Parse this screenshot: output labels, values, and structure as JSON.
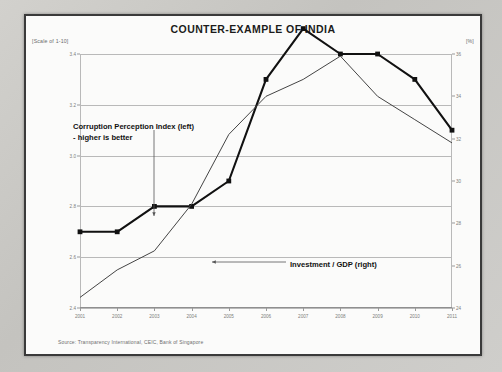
{
  "slide": {
    "title": "COUNTER-EXAMPLE OF INDIA",
    "source": "Source: Transparency International, CEIC, Bank of Singapore",
    "left_axis_note": "[Scale of 1-10]",
    "right_axis_note": "[%]",
    "annotation_cpi_line1": "Corruption Perception Index (left)",
    "annotation_cpi_line2": "- higher is better",
    "annotation_investment": "Investment / GDP (right)"
  },
  "chart_data": {
    "type": "line",
    "title": "COUNTER-EXAMPLE OF INDIA",
    "xlabel": "",
    "ylabel": "[Scale of 1-10]",
    "y2label": "[%]",
    "grid": true,
    "legend": "annotations",
    "categories": [
      "2001",
      "2002",
      "2003",
      "2004",
      "2005",
      "2006",
      "2007",
      "2008",
      "2009",
      "2010",
      "2011"
    ],
    "ylim": [
      2.4,
      3.4
    ],
    "yticks": [
      "2.4",
      "2.6",
      "2.8",
      "3.0",
      "3.2",
      "3.4"
    ],
    "y2lim": [
      24,
      36
    ],
    "y2ticks": [
      "24",
      "26",
      "28",
      "30",
      "32",
      "34",
      "36"
    ],
    "series": [
      {
        "name": "Corruption Perception Index (left)",
        "axis": "left",
        "marker": "square",
        "color": "#111111",
        "values": [
          2.7,
          2.7,
          2.8,
          2.8,
          2.9,
          3.3,
          3.5,
          3.4,
          3.4,
          3.3,
          3.1
        ]
      },
      {
        "name": "Investment / GDP (right)",
        "axis": "right",
        "marker": "none",
        "color": "#444444",
        "values": [
          24.5,
          25.8,
          26.7,
          28.9,
          32.2,
          34.0,
          34.8,
          35.9,
          34.0,
          32.9,
          31.8
        ]
      }
    ]
  }
}
